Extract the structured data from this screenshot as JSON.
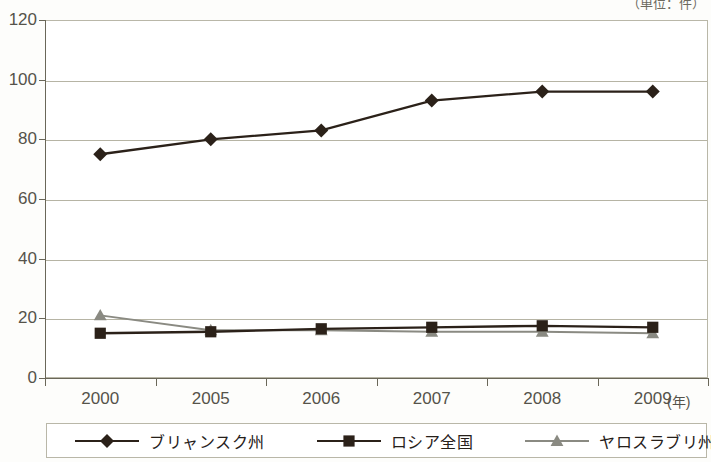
{
  "unit_note": "（単位：件）",
  "axes": {
    "y_ticks": [
      "120",
      "100",
      "80",
      "60",
      "40",
      "20",
      "0"
    ],
    "x_ticks": [
      "2000",
      "2005",
      "2006",
      "2007",
      "2008",
      "2009"
    ],
    "x_axis_unit": "(年)"
  },
  "legend": {
    "items": [
      {
        "label": "ブリャンスク州",
        "marker": "diamond-marker",
        "color": "#2b2119"
      },
      {
        "label": "ロシア全国",
        "marker": "square-marker",
        "color": "#2b2119"
      },
      {
        "label": "ヤロスラブリ州",
        "marker": "triangle-marker",
        "color": "#8a8a82"
      }
    ]
  },
  "colors": {
    "series_1": "#2b2119",
    "series_2": "#2b2119",
    "series_3": "#8a8a82",
    "gridline": "#b6b4a4",
    "axis": "#6a6759",
    "axis_text": "#55534a",
    "background": "#ffffff"
  },
  "chart_data": {
    "type": "line",
    "title": "",
    "subtitle": "",
    "xlabel": "(年)",
    "ylabel": "",
    "unit": "（単位：件）",
    "categories": [
      "2000",
      "2005",
      "2006",
      "2007",
      "2008",
      "2009"
    ],
    "x": [
      2000,
      2005,
      2006,
      2007,
      2008,
      2009
    ],
    "ylim": [
      0,
      120
    ],
    "ytick_interval": 20,
    "grid": true,
    "legend_position": "bottom",
    "series": [
      {
        "name": "ブリャンスク州",
        "marker": "diamond",
        "color": "#2b2119",
        "values": [
          75,
          80,
          83,
          93,
          96,
          96
        ]
      },
      {
        "name": "ロシア全国",
        "marker": "square",
        "color": "#2b2119",
        "values": [
          15,
          15.5,
          16.5,
          17,
          17.5,
          17
        ]
      },
      {
        "name": "ヤロスラブリ州",
        "marker": "triangle",
        "color": "#8a8a82",
        "values": [
          21,
          16,
          16,
          15.5,
          15.5,
          15
        ]
      }
    ]
  }
}
